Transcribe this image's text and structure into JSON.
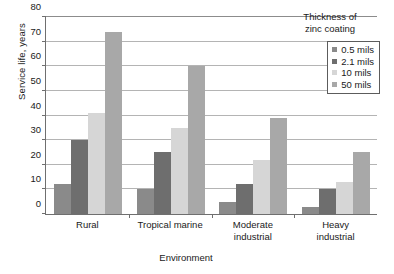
{
  "chart_data": {
    "type": "bar",
    "title": "",
    "xlabel": "Environment",
    "ylabel": "Service life, years",
    "categories": [
      "Rural",
      "Tropical marine",
      "Moderate industrial",
      "Heavy industrial"
    ],
    "category_lines": [
      [
        "Rural"
      ],
      [
        "Tropical marine"
      ],
      [
        "Moderate",
        "industrial"
      ],
      [
        "Heavy",
        "industrial"
      ]
    ],
    "series": [
      {
        "name": "0.5 mils",
        "color": "#8a8a8a",
        "values": [
          12,
          10,
          5,
          3
        ]
      },
      {
        "name": "2.1 mils",
        "color": "#6e6e6e",
        "values": [
          30,
          25,
          12,
          10
        ]
      },
      {
        "name": "10 mils",
        "color": "#d6d6d6",
        "values": [
          41,
          35,
          22,
          13
        ]
      },
      {
        "name": "50 mils",
        "color": "#a8a8a8",
        "values": [
          74,
          60,
          39,
          25
        ]
      }
    ],
    "ylim": [
      0,
      80
    ],
    "yticks": [
      0,
      10,
      20,
      30,
      40,
      50,
      60,
      70,
      80
    ],
    "ytick_labels": [
      "0",
      "10",
      "20",
      "30",
      "40",
      "50",
      "60",
      "70",
      "80"
    ],
    "grid": true,
    "legend_position": "top-right"
  },
  "legend": {
    "title_lines": [
      "Thickness of",
      "zinc coating"
    ],
    "title": "Thickness of zinc coating"
  },
  "colors": {
    "axis": "#6f6f6f",
    "grid": "#b4b4b4",
    "text": "#1a1a1a",
    "background": "#ffffff"
  }
}
